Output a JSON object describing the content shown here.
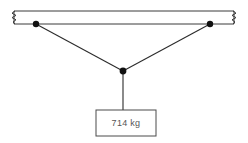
{
  "diagram": {
    "type": "free-body-diagram",
    "background_color": "#ffffff",
    "line_color": "#3a3a3a",
    "node_color": "#111111",
    "beam": {
      "name": "ceiling-beam",
      "x_left": 14,
      "x_right": 234,
      "y_top": 11,
      "y_bottom": 24,
      "fill": "#ffffff",
      "break_left": true,
      "break_right": true
    },
    "nodes": [
      {
        "name": "left-anchor",
        "x": 36,
        "y": 24,
        "radius": 3.2
      },
      {
        "name": "right-anchor",
        "x": 210,
        "y": 24,
        "radius": 3.2
      },
      {
        "name": "junction",
        "x": 123,
        "y": 71,
        "radius": 3.4
      }
    ],
    "cables": [
      {
        "name": "left-cable",
        "x1": 36,
        "y1": 24,
        "x2": 123,
        "y2": 71
      },
      {
        "name": "right-cable",
        "x1": 210,
        "y1": 24,
        "x2": 123,
        "y2": 71
      }
    ],
    "hanger": {
      "name": "vertical-hanger",
      "x1": 123,
      "y1": 71,
      "x2": 123,
      "y2": 110
    },
    "load_box": {
      "name": "load-block",
      "x": 96,
      "y": 110,
      "width": 60,
      "height": 26,
      "label": "714 kg",
      "label_x": 126,
      "label_y": 124,
      "fill": "#ffffff",
      "stroke": "#4a4a4a"
    }
  }
}
